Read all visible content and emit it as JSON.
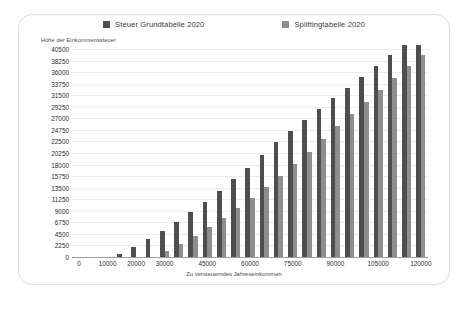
{
  "legend": {
    "position": "top-center",
    "entries": [
      {
        "label": "Steuer Grundtabelle 2020",
        "color": "#4e4e4e",
        "icon": "square-swatch"
      },
      {
        "label": "Splittingtabelle 2020",
        "color": "#8e8e8e",
        "icon": "square-swatch"
      }
    ]
  },
  "axes": {
    "y_title": "Höhe der Einkommenssteuer",
    "x_title": "Zu versteuerndes Jahreseinkommen"
  },
  "chart_data": {
    "type": "bar",
    "title": "",
    "subtitle": "",
    "xlabel": "Zu versteuerndes Jahreseinkommen",
    "ylabel": "Höhe der Einkommenssteuer",
    "grid": true,
    "legend_position": "top-center",
    "ylim": [
      0,
      40500
    ],
    "ytick_step": 2250,
    "yticks": [
      0,
      2250,
      4500,
      6750,
      9000,
      11250,
      13500,
      15750,
      18000,
      20250,
      22500,
      24750,
      27000,
      29250,
      31500,
      33750,
      36000,
      38250,
      40500
    ],
    "ytick_labels": [
      "0",
      "2250",
      "4500",
      "6750",
      "9000",
      "11250",
      "13500",
      "15750",
      "18000",
      "20250",
      "22500",
      "24750",
      "27000",
      "29250",
      "31500",
      "33750",
      "36000",
      "38250",
      "40500"
    ],
    "xtick_labels": [
      "0",
      "10000",
      "20000",
      "30000",
      "45000",
      "60000",
      "75000",
      "90000",
      "105000",
      "120000"
    ],
    "xlim": [
      0,
      125000
    ],
    "categories": [
      0,
      5000,
      10000,
      15000,
      20000,
      25000,
      30000,
      35000,
      40000,
      45000,
      50000,
      55000,
      60000,
      65000,
      70000,
      75000,
      80000,
      85000,
      90000,
      95000,
      100000,
      105000,
      110000,
      115000,
      120000
    ],
    "series": [
      {
        "name": "Steuer Grundtabelle 2020",
        "color": "#4e4e4e",
        "values": [
          0,
          0,
          0,
          600,
          1950,
          3450,
          5100,
          6900,
          8800,
          10800,
          12900,
          15100,
          17400,
          19800,
          22300,
          24600,
          26700,
          28800,
          30900,
          33000,
          35100,
          37200,
          39300,
          41400,
          43500
        ]
      },
      {
        "name": "Splittingtabelle 2020",
        "color": "#8e8e8e",
        "values": [
          0,
          0,
          0,
          0,
          0,
          0,
          1200,
          2600,
          4100,
          5800,
          7600,
          9500,
          11500,
          13600,
          15800,
          18100,
          20500,
          23000,
          25600,
          27900,
          30200,
          32500,
          34800,
          37100,
          39400
        ]
      }
    ]
  }
}
